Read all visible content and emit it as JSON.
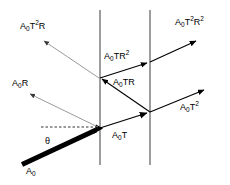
{
  "figure": {
    "type": "optics-ray-diagram",
    "width": 230,
    "height": 185,
    "background_color": "#ffffff",
    "stroke_color": "#000000",
    "faint_stroke_color": "#9a9a9a"
  },
  "surfaces": [
    {
      "name": "first-interface",
      "x": 100,
      "y1": 10,
      "y2": 165
    },
    {
      "name": "second-interface",
      "x": 150,
      "y1": 10,
      "y2": 165
    }
  ],
  "nodes": [
    {
      "name": "entry-point",
      "x": 100,
      "y": 128
    },
    {
      "name": "upper-left-node",
      "x": 100,
      "y": 78
    },
    {
      "name": "lower-right-node",
      "x": 150,
      "y": 112
    },
    {
      "name": "upper-right-node",
      "x": 150,
      "y": 62
    }
  ],
  "rays": [
    {
      "name": "incident-ray",
      "label": "A₀",
      "style": "thick",
      "x1": 22,
      "y1": 164,
      "x2": 100,
      "y2": 128
    },
    {
      "name": "reflected-ray-A0R",
      "label": "A₀R",
      "style": "faint",
      "x1": 100,
      "y1": 128,
      "x2": 26,
      "y2": 92
    },
    {
      "name": "transmitted-ray-A0T",
      "label": "A₀T",
      "style": "thin",
      "x1": 100,
      "y1": 128,
      "x2": 150,
      "y2": 112
    },
    {
      "name": "transmitted-ray-A0T2",
      "label": "A₀T²",
      "style": "thin",
      "x1": 150,
      "y1": 112,
      "x2": 207,
      "y2": 89
    },
    {
      "name": "internal-ray-A0TR",
      "label": "A₀TR",
      "style": "thin",
      "x1": 150,
      "y1": 112,
      "x2": 100,
      "y2": 78
    },
    {
      "name": "internal-ray-A0TR2",
      "label": "A₀TR²",
      "style": "thin",
      "x1": 100,
      "y1": 78,
      "x2": 150,
      "y2": 62
    },
    {
      "name": "emergent-ray-A0T2R2",
      "label": "A₀T²R²",
      "style": "thin",
      "x1": 150,
      "y1": 62,
      "x2": 198,
      "y2": 40
    },
    {
      "name": "reflected-ray-A0T2R",
      "label": "A₀T²R",
      "style": "faint",
      "x1": 100,
      "y1": 78,
      "x2": 40,
      "y2": 38
    }
  ],
  "guide": {
    "name": "normal-dashed-line",
    "x1": 41,
    "y1": 127,
    "x2": 100,
    "y2": 127,
    "style": "dashed"
  },
  "labels": {
    "incident": {
      "base": "A",
      "sub": "0",
      "sup": ""
    },
    "theta": "θ",
    "a0r": {
      "base": "A",
      "sub": "0",
      "tail": "R"
    },
    "a0t2r": {
      "base": "A",
      "sub": "0",
      "mid": "T",
      "sup": "2",
      "tail": "R"
    },
    "a0t": {
      "base": "A",
      "sub": "0",
      "tail": "T"
    },
    "a0t2": {
      "base": "A",
      "sub": "0",
      "mid": "T",
      "sup": "2"
    },
    "a0tr": {
      "base": "A",
      "sub": "0",
      "tail": "TR"
    },
    "a0tr2": {
      "base": "A",
      "sub": "0",
      "mid": "TR",
      "sup": "2"
    },
    "a0t2r2": {
      "base": "A",
      "sub": "0",
      "mid": "T",
      "sup": "2",
      "tail": "R",
      "sup2": "2"
    }
  },
  "text": {
    "A_letter": "A",
    "zero": "0",
    "T": "T",
    "R": "R",
    "TR": "TR",
    "two": "2",
    "theta": "θ"
  }
}
